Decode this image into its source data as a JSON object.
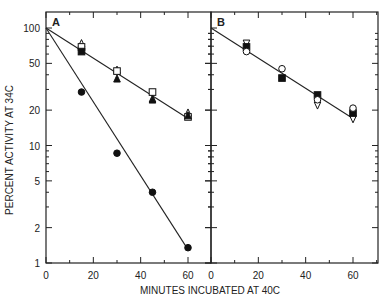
{
  "chart_data": {
    "type": "scatter",
    "title": "",
    "xlabel": "MINUTES INCUBATED AT 40C",
    "ylabel": "PERCENT ACTIVITY AT 34C",
    "yscale": "log",
    "ylim": [
      1,
      100
    ],
    "xlim": [
      0,
      70
    ],
    "grid": false,
    "yticks": [
      1,
      2,
      5,
      10,
      20,
      50,
      100
    ],
    "ytick_labels": [
      "1",
      "2",
      "5",
      "10",
      "20",
      "50",
      "100"
    ],
    "xticks": [
      0,
      20,
      40,
      60
    ],
    "xtick_labels": [
      "0",
      "20",
      "40",
      "60"
    ],
    "panels": [
      {
        "label": "A",
        "series": [
          {
            "name": "open triangle",
            "marker": "triangle-up-open",
            "x": [
              0,
              15,
              30,
              45,
              60
            ],
            "y": [
              100,
              74,
              44,
              25,
              19
            ]
          },
          {
            "name": "open square",
            "marker": "square-open",
            "x": [
              0,
              15,
              30,
              45,
              60
            ],
            "y": [
              100,
              69,
              43,
              28.5,
              17.5
            ]
          },
          {
            "name": "filled square",
            "marker": "square-filled",
            "x": [
              0,
              15
            ],
            "y": [
              100,
              63
            ]
          },
          {
            "name": "filled triangle",
            "marker": "triangle-up-filled",
            "x": [
              0,
              30,
              45,
              60
            ],
            "y": [
              100,
              37,
              24.5,
              18
            ]
          },
          {
            "name": "filled circle",
            "marker": "circle-filled",
            "x": [
              0,
              15,
              30,
              45,
              60
            ],
            "y": [
              100,
              28.5,
              8.6,
              4,
              1.35
            ]
          }
        ],
        "fit_lines": [
          {
            "from": [
              0,
              100
            ],
            "to": [
              60,
              17
            ]
          },
          {
            "from": [
              0,
              100
            ],
            "to": [
              60,
              1.3
            ]
          }
        ]
      },
      {
        "label": "B",
        "series": [
          {
            "name": "open inverted triangle",
            "marker": "triangle-down-open",
            "x": [
              0,
              15,
              45,
              60
            ],
            "y": [
              100,
              74,
              22,
              16.8
            ]
          },
          {
            "name": "filled square",
            "marker": "square-filled",
            "x": [
              0,
              15,
              30,
              45,
              60
            ],
            "y": [
              100,
              69,
              37.5,
              26.9,
              18.9
            ]
          },
          {
            "name": "open circle",
            "marker": "circle-open",
            "x": [
              0,
              15,
              30,
              45,
              60
            ],
            "y": [
              100,
              63,
              45,
              24.5,
              20.8
            ]
          }
        ],
        "fit_lines": [
          {
            "from": [
              0,
              100
            ],
            "to": [
              60,
              17
            ]
          }
        ]
      }
    ]
  }
}
